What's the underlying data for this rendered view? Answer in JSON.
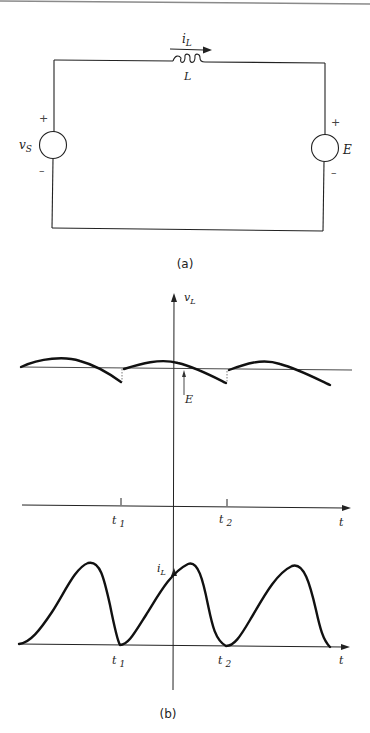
{
  "figure": {
    "top_rule": true,
    "circuit": {
      "caption": "(a)",
      "inductor": {
        "label": "L",
        "current_label_main": "i",
        "current_label_sub": "L"
      },
      "source_left": {
        "label_main": "v",
        "label_sub": "S",
        "plus": "+",
        "minus": "–"
      },
      "source_right": {
        "label": "E",
        "plus": "+",
        "minus": "–"
      }
    },
    "waveforms": {
      "caption": "(b)",
      "voltage_plot": {
        "y_label_main": "v",
        "y_label_sub": "L",
        "level_label": "E",
        "x_label": "t",
        "ticks": [
          {
            "main": "t",
            "sub": "1"
          },
          {
            "main": "t",
            "sub": "2"
          }
        ]
      },
      "current_plot": {
        "y_label_main": "i",
        "y_label_sub": "L",
        "x_label": "t",
        "ticks": [
          {
            "main": "t",
            "sub": "1"
          },
          {
            "main": "t",
            "sub": "2"
          }
        ]
      }
    }
  },
  "colors": {
    "line": "#111111",
    "thin": "#333333",
    "rule": "#888888"
  }
}
